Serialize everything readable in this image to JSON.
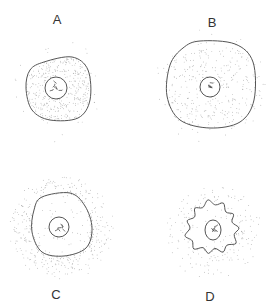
{
  "figure": {
    "type": "cell-diagram",
    "stroke_color": "#555555",
    "stipple_color": "#9a9a9a",
    "panels": [
      {
        "id": "A",
        "label": "A",
        "label_pos": [
          57,
          19
        ],
        "cell": {
          "cx": 58,
          "cy": 89,
          "rx": 32,
          "ry": 32,
          "wavy": false,
          "shape": [
            [
              44,
              62
            ],
            [
              72,
              57
            ],
            [
              88,
              70
            ],
            [
              90,
              100
            ],
            [
              78,
              118
            ],
            [
              50,
              120
            ],
            [
              32,
              110
            ],
            [
              26,
              88
            ],
            [
              30,
              70
            ]
          ]
        },
        "nucleus": {
          "cx": 56,
          "cy": 88,
          "rx": 11,
          "ry": 11
        },
        "stipple_inside": 0.9,
        "stipple_outside": 0.08,
        "halo": {
          "cx": 58,
          "cy": 89,
          "r": 55
        }
      },
      {
        "id": "B",
        "label": "B",
        "label_pos": [
          212,
          22
        ],
        "cell": {
          "cx": 210,
          "cy": 85,
          "wavy": false,
          "shape": [
            [
              200,
              41
            ],
            [
              235,
              44
            ],
            [
              253,
              62
            ],
            [
              254,
              100
            ],
            [
              240,
              122
            ],
            [
              210,
              128
            ],
            [
              180,
              120
            ],
            [
              167,
              96
            ],
            [
              170,
              65
            ],
            [
              183,
              48
            ]
          ]
        },
        "nucleus": {
          "cx": 210,
          "cy": 87,
          "rx": 10,
          "ry": 10
        },
        "stipple_inside": 0.35,
        "stipple_outside": 0.35,
        "halo": {
          "cx": 210,
          "cy": 85,
          "r": 60
        }
      },
      {
        "id": "C",
        "label": "C",
        "label_pos": [
          56,
          294
        ],
        "cell": {
          "cx": 61,
          "cy": 225,
          "wavy": false,
          "shape": [
            [
              42,
              197
            ],
            [
              70,
              193
            ],
            [
              85,
              206
            ],
            [
              92,
              228
            ],
            [
              86,
              248
            ],
            [
              64,
              256
            ],
            [
              42,
              252
            ],
            [
              32,
              232
            ],
            [
              34,
              210
            ]
          ]
        },
        "nucleus": {
          "cx": 59,
          "cy": 227,
          "rx": 10,
          "ry": 10
        },
        "stipple_inside": 0.12,
        "stipple_outside": 0.85,
        "halo": {
          "cx": 61,
          "cy": 228,
          "r": 54
        }
      },
      {
        "id": "D",
        "label": "D",
        "label_pos": [
          210,
          296
        ],
        "cell": {
          "cx": 212,
          "cy": 228,
          "wavy": true,
          "r": 24
        },
        "nucleus": {
          "cx": 213,
          "cy": 230,
          "rx": 8,
          "ry": 10
        },
        "stipple_inside": 0.12,
        "stipple_outside": 0.3,
        "halo": {
          "cx": 213,
          "cy": 230,
          "r": 52
        }
      }
    ]
  }
}
